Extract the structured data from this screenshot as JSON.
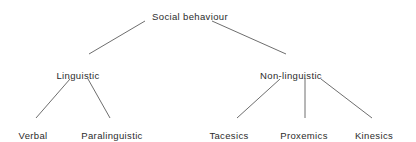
{
  "diagram": {
    "type": "tree",
    "title": "Social behaviour",
    "background_color": "#ffffff",
    "line_color": "#6e6e6e",
    "text_color": "#2b2b2b",
    "nodes": {
      "root": {
        "label": "Social behaviour",
        "x": 190,
        "y": 11
      },
      "mid_left": {
        "label": "Linguistic",
        "x": 78,
        "y": 70
      },
      "mid_right": {
        "label": "Non-linguistic",
        "x": 291,
        "y": 70
      },
      "leaf_1": {
        "label": "Verbal",
        "x": 33,
        "y": 130
      },
      "leaf_2": {
        "label": "Paralinguistic",
        "x": 112,
        "y": 130
      },
      "leaf_3": {
        "label": "Tacesics",
        "x": 229,
        "y": 130
      },
      "leaf_4": {
        "label": "Proxemics",
        "x": 304,
        "y": 130
      },
      "leaf_5": {
        "label": "Kinesics",
        "x": 374,
        "y": 130
      }
    },
    "edges": [
      {
        "name": "root-to-linguistic",
        "x1": 145,
        "y1": 21,
        "x2": 89,
        "y2": 54
      },
      {
        "name": "root-to-non-linguistic",
        "x1": 212,
        "y1": 21,
        "x2": 286,
        "y2": 54
      },
      {
        "name": "linguistic-to-verbal",
        "x1": 70,
        "y1": 79,
        "x2": 36,
        "y2": 118
      },
      {
        "name": "linguistic-to-paralinguistic",
        "x1": 88,
        "y1": 79,
        "x2": 110,
        "y2": 118
      },
      {
        "name": "non-linguistic-to-tacesics",
        "x1": 280,
        "y1": 79,
        "x2": 237,
        "y2": 118
      },
      {
        "name": "non-linguistic-to-proxemics",
        "x1": 305,
        "y1": 78,
        "x2": 305,
        "y2": 118
      },
      {
        "name": "non-linguistic-to-kinesics",
        "x1": 321,
        "y1": 79,
        "x2": 372,
        "y2": 118
      }
    ]
  }
}
